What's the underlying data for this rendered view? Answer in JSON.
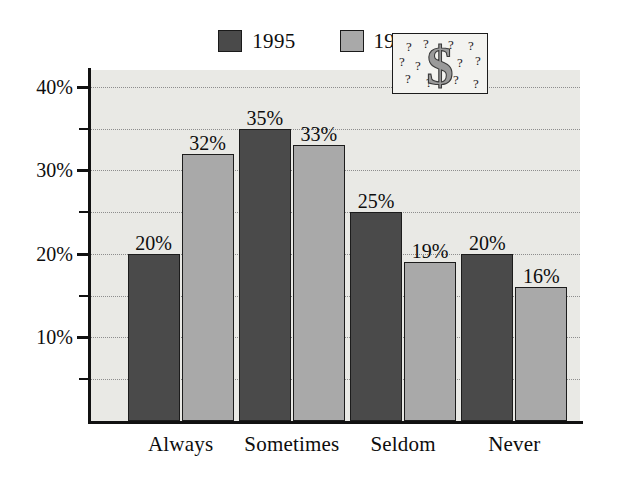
{
  "chart_data": {
    "type": "bar",
    "title": "",
    "subtitle": "",
    "xlabel": "",
    "ylabel": "",
    "categories": [
      "Always",
      "Sometimes",
      "Seldom",
      "Never"
    ],
    "series": [
      {
        "name": "1995",
        "color": "#4a4a4a",
        "values": [
          20,
          35,
          25,
          20
        ],
        "labels": [
          "20%",
          "35%",
          "25%",
          "20%"
        ]
      },
      {
        "name": "1996",
        "color": "#a9a9a9",
        "values": [
          32,
          33,
          19,
          16
        ],
        "labels": [
          "32%",
          "33%",
          "19%",
          "16%"
        ]
      }
    ],
    "ylim": [
      0,
      42
    ],
    "ytick_values": [
      10,
      20,
      30,
      40
    ],
    "ytick_labels": [
      "10%",
      "20%",
      "30%",
      "40%"
    ],
    "yminor_values": [
      5,
      15,
      25,
      35
    ],
    "grid": "horizontal-dotted",
    "legend_position": "top-center",
    "plot_background": "#e9e9e5",
    "axis_color": "#111111",
    "gridline_color": "#8d8d8d"
  },
  "legend": {
    "entries": [
      {
        "label": "1995",
        "color": "#4a4a4a"
      },
      {
        "label": "1996",
        "color": "#a9a9a9"
      }
    ]
  },
  "inset": {
    "name": "dollar-sign-question-marks",
    "symbol": "$",
    "question_marks": [
      "?",
      "?",
      "?",
      "?",
      "?",
      "?",
      "?",
      "?",
      "?",
      "?",
      "?",
      "?"
    ],
    "fill": "#9a9a9a",
    "background": "#f3f3f0"
  }
}
